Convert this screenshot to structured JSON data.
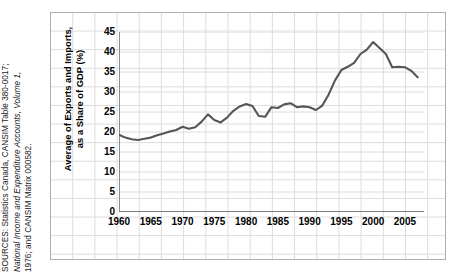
{
  "source_note": {
    "lines": [
      "SOURCES: Statistics Canada, CANSIM Table 380-0017;",
      "National Income and Expenditure Accounts, Volume 1,",
      "1976; and CANSIM Matrix 000582."
    ]
  },
  "axis_title": {
    "line1": "Average of Exports and Imports,",
    "line2": "as a Share of GDP (%)"
  },
  "colors": {
    "line": "#555555",
    "grid": "#dcdcdc",
    "axis": "#595959",
    "frame": "#aeaeae",
    "text": "#000000"
  },
  "chart_data": {
    "type": "line",
    "title": "",
    "xlabel": "",
    "ylabel": "Average of Exports and Imports, as a Share of GDP (%)",
    "xlim": [
      1960,
      2008
    ],
    "ylim": [
      0,
      45
    ],
    "ytick_labels": [
      "45",
      "40",
      "35",
      "30",
      "25",
      "20",
      "15",
      "10",
      "5",
      "0"
    ],
    "yticks": [
      45,
      40,
      35,
      30,
      25,
      20,
      15,
      10,
      5,
      0
    ],
    "xtick_labels": [
      "1960",
      "1965",
      "1970",
      "1975",
      "1980",
      "1985",
      "1990",
      "1995",
      "2000",
      "2005"
    ],
    "xticks": [
      1960,
      1965,
      1970,
      1975,
      1980,
      1985,
      1990,
      1995,
      2000,
      2005
    ],
    "grid": true,
    "legend": false,
    "series": [
      {
        "name": "Average of Exports and Imports as a Share of GDP",
        "x": [
          1960,
          1961,
          1962,
          1963,
          1964,
          1965,
          1966,
          1967,
          1968,
          1969,
          1970,
          1971,
          1972,
          1973,
          1974,
          1975,
          1976,
          1977,
          1978,
          1979,
          1980,
          1981,
          1982,
          1983,
          1984,
          1985,
          1986,
          1987,
          1988,
          1989,
          1990,
          1991,
          1992,
          1993,
          1994,
          1995,
          1996,
          1997,
          1998,
          1999,
          2000,
          2001,
          2002,
          2003,
          2004,
          2005,
          2006,
          2007
        ],
        "values": [
          19.3,
          18.6,
          18.2,
          18.0,
          18.3,
          18.6,
          19.2,
          19.6,
          20.1,
          20.5,
          21.3,
          20.8,
          21.2,
          22.6,
          24.4,
          23.0,
          22.4,
          23.6,
          25.3,
          26.4,
          27.0,
          26.5,
          24.0,
          23.8,
          26.2,
          26.0,
          26.9,
          27.2,
          26.2,
          26.4,
          26.2,
          25.5,
          26.6,
          29.4,
          32.9,
          35.5,
          36.3,
          37.3,
          39.5,
          40.6,
          42.5,
          41.0,
          39.5,
          36.2,
          36.3,
          36.2,
          35.3,
          33.7
        ]
      }
    ]
  }
}
